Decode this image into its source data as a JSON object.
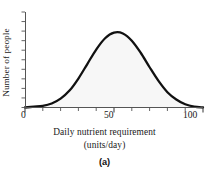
{
  "figure": {
    "panel_label": "(a)",
    "background_color": "#ffffff",
    "curve_color": "#111111",
    "fill_color": "#f7f7f7",
    "axis_color": "#555555"
  },
  "chart_data": {
    "type": "area",
    "title": "",
    "subtitle": "",
    "xlabel": "Daily nutrient requirement",
    "xlabel_units": "(units/day)",
    "ylabel": "Number of people",
    "xlim": [
      0,
      100
    ],
    "ylim": [
      0,
      100
    ],
    "grid": false,
    "legend": "none",
    "x_tick_labels": [
      "0",
      "50",
      "100"
    ],
    "x_tick_values": [
      0,
      50,
      100
    ],
    "x_minor_tick_values": [
      0,
      10,
      20,
      30,
      40,
      50,
      60,
      70,
      80,
      90,
      100
    ],
    "y_tick_labels": [],
    "y_minor_tick_count": 11,
    "annotations": [],
    "series": [
      {
        "name": "Distribution of nutrient requirement",
        "x": [
          0,
          5,
          10,
          15,
          20,
          25,
          30,
          35,
          40,
          45,
          50,
          55,
          60,
          65,
          70,
          75,
          80,
          85,
          90,
          95,
          100
        ],
        "y": [
          0,
          1,
          2,
          5,
          11,
          21,
          36,
          54,
          72,
          86,
          93,
          92,
          83,
          68,
          50,
          33,
          19,
          10,
          4,
          1,
          0
        ]
      }
    ]
  }
}
